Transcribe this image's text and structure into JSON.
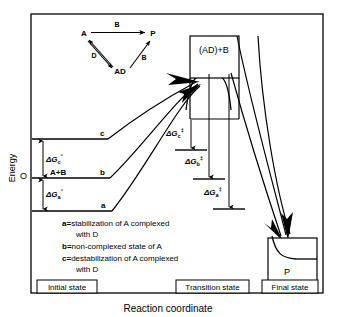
{
  "figure": {
    "axis": {
      "y_label": "Energy",
      "x_label": "Reaction coordinate",
      "origin_label": "O"
    },
    "scheme": {
      "reactant": "A",
      "product": "P",
      "complex": "AD",
      "arrow_top_label": "B",
      "arrow_left_label": "D",
      "arrow_right_label": "B"
    },
    "energy_levels": [
      {
        "id": "c",
        "label": "c",
        "description": "destabilized level"
      },
      {
        "id": "b",
        "label": "b",
        "level_text": "A+B",
        "description": "non-complexed level"
      },
      {
        "id": "a",
        "label": "a",
        "description": "stabilized level"
      }
    ],
    "delta_g_initial": [
      {
        "symbol": "ΔG",
        "sub": "c",
        "sup": "°"
      },
      {
        "symbol": "ΔG",
        "sub": "a",
        "sup": "°"
      }
    ],
    "delta_g_activation": [
      {
        "symbol": "ΔG",
        "sub": "c",
        "sup": "‡"
      },
      {
        "symbol": "ΔG",
        "sub": "b",
        "sup": "‡"
      },
      {
        "symbol": "ΔG",
        "sub": "a",
        "sup": "‡"
      }
    ],
    "transition_state_label": "(AD)+B",
    "final_state_label": "P",
    "legend": [
      {
        "key": "a=",
        "text": "stabilization of A complexed",
        "cont": "with D"
      },
      {
        "key": "b=",
        "text": "non-complexed state of A",
        "cont": ""
      },
      {
        "key": "c=",
        "text": "destabilization of A complexed",
        "cont": "with D"
      }
    ],
    "stage_labels": [
      {
        "id": "initial",
        "text": "Initial state"
      },
      {
        "id": "transition",
        "text": "Transition state"
      },
      {
        "id": "final",
        "text": "Final state"
      }
    ],
    "colors": {
      "line": "#000000",
      "background": "#ffffff"
    }
  }
}
